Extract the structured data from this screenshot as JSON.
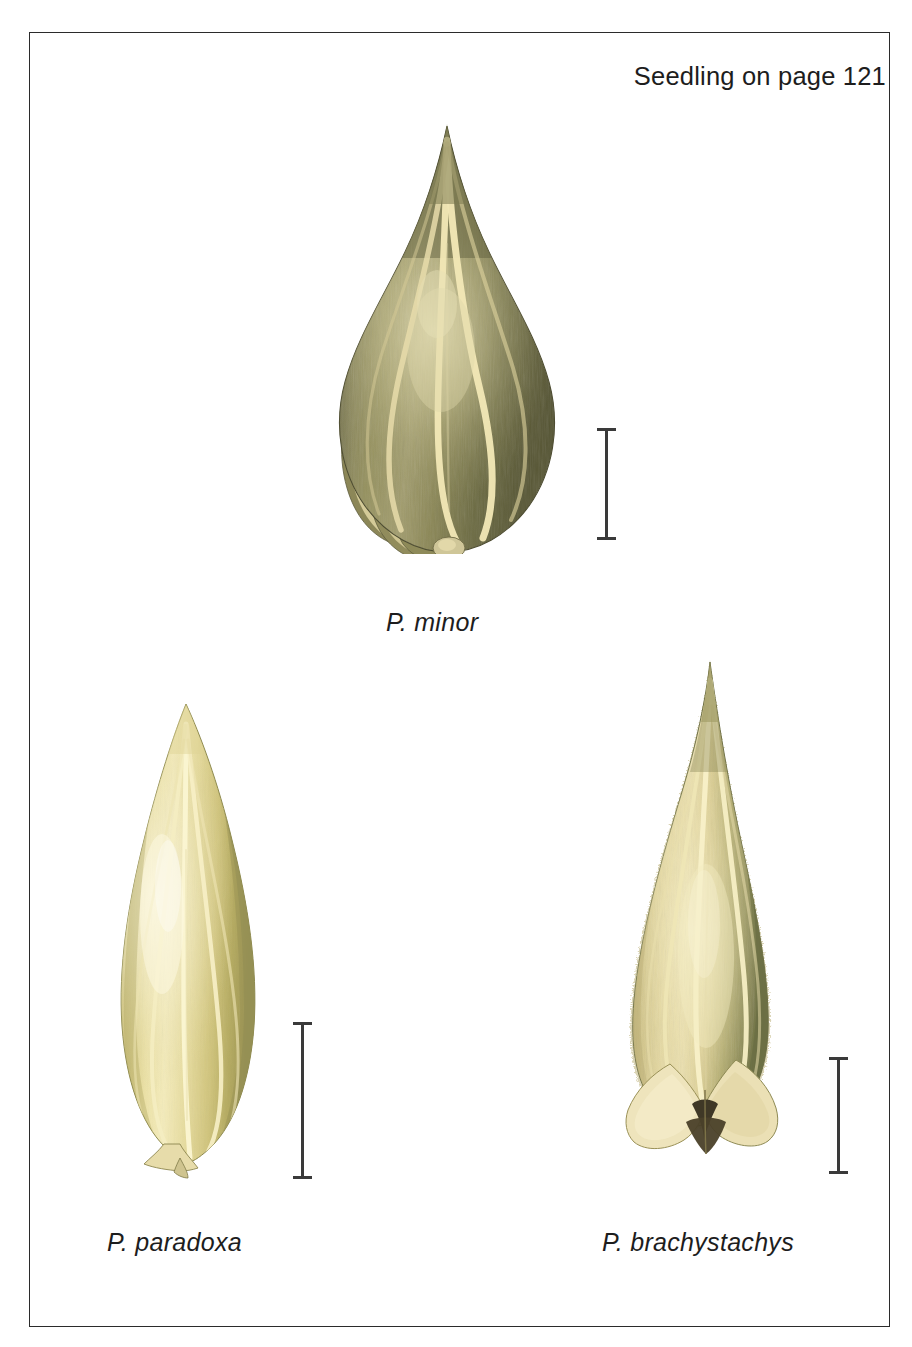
{
  "plate": {
    "width": 912,
    "height": 1347,
    "background_color": "#ffffff",
    "frame_color": "#2b2b2b"
  },
  "header": {
    "note": "Seedling on page 121"
  },
  "specimens": [
    {
      "id": "minor",
      "caption": "P. minor",
      "icon": "spikelet-ovate-icon",
      "position": "top-center",
      "shape": "broadly ovate, teardrop, acute apex",
      "colors": {
        "body_dark": "#5d5c3c",
        "body_mid": "#7d7a52",
        "body_light": "#a8a274",
        "rib": "#efe4b0",
        "highlight": "#d8d2a6",
        "shadow": "#45442c"
      },
      "scalebar": {
        "color": "#3a3a3a",
        "orientation": "vertical",
        "length_px": 112
      }
    },
    {
      "id": "paradoxa",
      "caption": "P. paradoxa",
      "icon": "spikelet-lanceolate-icon",
      "position": "bottom-left",
      "shape": "narrow lanceolate, obtuse apex, tapering stalked base",
      "colors": {
        "body_dark": "#a99e58",
        "body_mid": "#d3c77e",
        "body_light": "#ece1a4",
        "rib": "#f6efc4",
        "highlight": "#f7f2d4",
        "shadow": "#8e8a4e"
      },
      "scalebar": {
        "color": "#3a3a3a",
        "orientation": "vertical",
        "length_px": 157
      }
    },
    {
      "id": "brachystachys",
      "caption": "P. brachystachys",
      "icon": "spikelet-acuminate-icon",
      "position": "bottom-right",
      "shape": "narrow lance, long acuminate apex, pubescent margins, flared basal bracts",
      "colors": {
        "body_dark": "#7c7a4c",
        "body_mid": "#c0b275",
        "body_light": "#e3d6a2",
        "rib": "#f5edc6",
        "highlight": "#f2e9bd",
        "shadow": "#5e5f3c",
        "bract": "#eee4bc",
        "base_dark": "#3d3524"
      },
      "scalebar": {
        "color": "#3a3a3a",
        "orientation": "vertical",
        "length_px": 117
      }
    }
  ]
}
